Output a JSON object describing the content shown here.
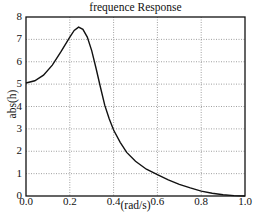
{
  "chart_data": {
    "type": "line",
    "title": "frequence Response",
    "xlabel": "(rad/s)",
    "ylabel": "abs(h)",
    "xlim": [
      0.0,
      1.0
    ],
    "ylim": [
      0,
      8
    ],
    "grid": true,
    "legend": null,
    "x_ticks": [
      "0.0",
      "0.2",
      "0.4",
      "0.6",
      "0.8",
      "1.0"
    ],
    "y_ticks": [
      "0",
      "1",
      "2",
      "3",
      "4",
      "5",
      "6",
      "7",
      "8"
    ],
    "series": [
      {
        "name": "abs(h)",
        "color": "#111111",
        "x": [
          0.0,
          0.04,
          0.08,
          0.12,
          0.16,
          0.2,
          0.22,
          0.24,
          0.26,
          0.28,
          0.3,
          0.32,
          0.34,
          0.36,
          0.38,
          0.4,
          0.43,
          0.46,
          0.5,
          0.55,
          0.6,
          0.65,
          0.7,
          0.75,
          0.8,
          0.85,
          0.9,
          0.95,
          1.0
        ],
        "y": [
          5.05,
          5.15,
          5.4,
          5.85,
          6.45,
          7.1,
          7.4,
          7.55,
          7.45,
          7.1,
          6.5,
          5.7,
          4.85,
          4.05,
          3.45,
          2.95,
          2.4,
          1.95,
          1.55,
          1.2,
          0.95,
          0.72,
          0.52,
          0.36,
          0.22,
          0.12,
          0.06,
          0.02,
          0.0
        ]
      }
    ]
  }
}
